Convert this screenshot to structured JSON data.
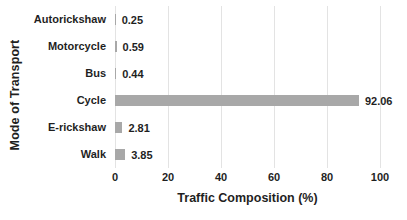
{
  "chart_data": {
    "type": "bar",
    "orientation": "horizontal",
    "title": "",
    "xlabel": "Traffic Composition (%)",
    "ylabel": "Mode of Transport",
    "categories": [
      "Autorickshaw",
      "Motorcycle",
      "Bus",
      "Cycle",
      "E-rickshaw",
      "Walk"
    ],
    "values": [
      0.25,
      0.59,
      0.44,
      92.06,
      2.81,
      3.85
    ],
    "value_labels": [
      "0.25",
      "0.59",
      "0.44",
      "92.06",
      "2.81",
      "3.85"
    ],
    "x_ticks": [
      "0",
      "20",
      "40",
      "60",
      "80",
      "100"
    ],
    "xlim": [
      0,
      100
    ],
    "grid": "vertical-gridlines",
    "legend": "none",
    "colors": {
      "bar_fill": "#a8a8a8",
      "gridline": "#e3e3e3",
      "text": "#1f1f1f",
      "background": "#ffffff"
    }
  }
}
